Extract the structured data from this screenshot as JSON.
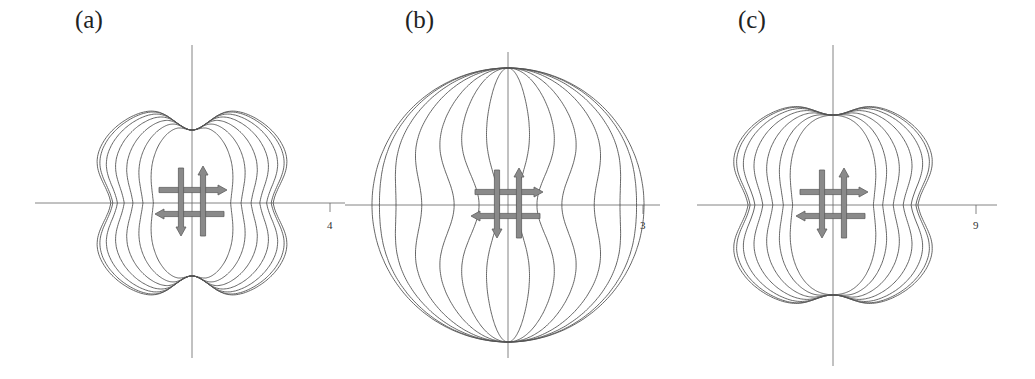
{
  "figure": {
    "type": "polar-pattern-diagram",
    "line_color": "#555555",
    "axis_color": "#666666",
    "arrow_fill": "#8a8a8a",
    "arrow_stroke": "#5e5e5e",
    "panels": [
      {
        "id": "a",
        "label": "(a)",
        "label_pos": [
          75,
          33
        ],
        "center": [
          192,
          203
        ],
        "v_axis": [
          45,
          358
        ],
        "h_axis": [
          35,
          345
        ],
        "tick": {
          "x": 330,
          "label": "4"
        },
        "shape": "butterfly",
        "rx_outer": 108,
        "ry_pinch": 73,
        "ry_lobe": 112,
        "contours": [
          1.0,
          0.97,
          0.9,
          0.8,
          0.68,
          0.55,
          0.4
        ]
      },
      {
        "id": "b",
        "label": "(b)",
        "label_pos": [
          405,
          33
        ],
        "center": [
          508,
          205
        ],
        "v_axis": [
          52,
          358
        ],
        "h_axis": [
          345,
          660
        ],
        "tick": {
          "x": 643,
          "label": "3"
        },
        "shape": "circle-lens",
        "rx_outer": 136,
        "ry": 137,
        "contours": [
          1.0,
          0.97,
          0.9,
          0.78,
          0.6,
          0.42,
          0.2
        ]
      },
      {
        "id": "c",
        "label": "(c)",
        "label_pos": [
          738,
          33
        ],
        "center": [
          833,
          205
        ],
        "v_axis": [
          45,
          366
        ],
        "h_axis": [
          697,
          997
        ],
        "tick": {
          "x": 976,
          "label": "9"
        },
        "shape": "butterfly",
        "rx_outer": 113,
        "ry_pinch": 90,
        "ry_lobe": 118,
        "contours": [
          1.0,
          0.97,
          0.9,
          0.79,
          0.66,
          0.53,
          0.4
        ]
      }
    ]
  }
}
